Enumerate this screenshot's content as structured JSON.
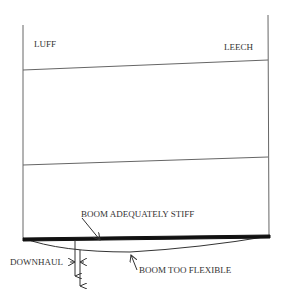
{
  "diagram": {
    "labels": {
      "luff": "LUFF",
      "leech": "LEECH",
      "boom_stiff": "BOOM ADEQUATELY STIFF",
      "boom_flexible": "BOOM TOO FLEXIBLE",
      "downhaul": "DOWNHAUL"
    },
    "colors": {
      "line": "#555555",
      "boom": "#111111",
      "text": "#333333"
    }
  }
}
